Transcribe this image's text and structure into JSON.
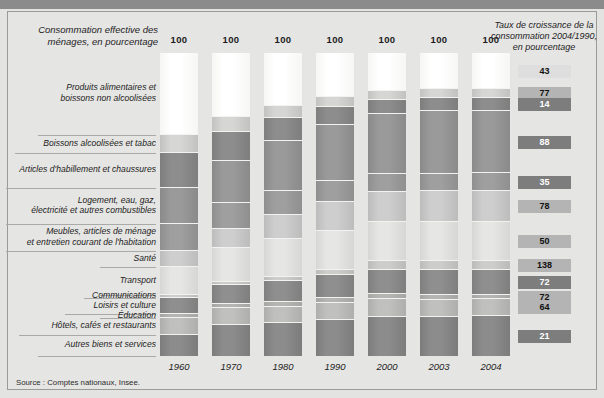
{
  "chart_data": {
    "type": "bar",
    "title": "Consommation effective des ménages, en pourcentage",
    "subtitle_right": "Taux de croissance de la consommation 2004/1990, en pourcentage",
    "xlabel": "",
    "ylabel": "",
    "ylim": [
      0,
      100
    ],
    "stacked": true,
    "normalized_total": 100,
    "grid": false,
    "legend": "left-labels",
    "categories": [
      "1960",
      "1970",
      "1980",
      "1990",
      "2000",
      "2003",
      "2004"
    ],
    "series": [
      {
        "name": "Produits alimentaires et boissons non alcoolisées",
        "values": [
          27.0,
          21.0,
          17.5,
          14.5,
          12.5,
          12.0,
          12.0
        ],
        "growth": 43
      },
      {
        "name": "Boissons alcoolisées et tabac",
        "values": [
          6.0,
          5.0,
          4.0,
          3.3,
          3.0,
          3.0,
          3.0
        ],
        "growth": 77
      },
      {
        "name": "Articles d'habillement et chaussures",
        "values": [
          11.5,
          9.5,
          7.5,
          6.0,
          4.8,
          4.3,
          4.2
        ],
        "growth": 14
      },
      {
        "name": "Logement, eau, gaz, électricité et autres combustibles",
        "values": [
          12.0,
          14.0,
          16.5,
          18.5,
          19.5,
          20.5,
          20.5
        ],
        "growth": 88
      },
      {
        "name": "Meubles, articles de ménage et entretien courant de l'habitation",
        "values": [
          9.0,
          8.5,
          8.0,
          6.8,
          6.0,
          5.8,
          5.8
        ],
        "growth": 35
      },
      {
        "name": "Santé",
        "values": [
          5.0,
          6.5,
          8.0,
          9.5,
          10.0,
          10.2,
          10.2
        ],
        "growth": 78
      },
      {
        "name": "Transport",
        "values": [
          9.5,
          11.0,
          12.5,
          13.0,
          13.0,
          12.8,
          12.8
        ],
        "growth": 50
      },
      {
        "name": "Communications",
        "values": [
          0.8,
          1.0,
          1.3,
          1.8,
          2.7,
          3.0,
          3.0
        ],
        "growth": 138
      },
      {
        "name": "Loisirs et culture",
        "values": [
          5.5,
          6.5,
          7.0,
          7.5,
          8.2,
          8.3,
          8.3
        ],
        "growth": 72
      },
      {
        "name": "Éducation",
        "values": [
          1.2,
          1.3,
          1.4,
          1.5,
          1.5,
          1.5,
          1.5
        ],
        "growth": 72
      },
      {
        "name": "Hôtels, cafés et restaurants",
        "values": [
          5.5,
          5.5,
          5.5,
          5.6,
          5.8,
          5.6,
          5.6
        ],
        "growth": 64
      },
      {
        "name": "Autres biens et services",
        "values": [
          7.0,
          10.2,
          10.8,
          12.0,
          13.0,
          13.0,
          13.1
        ],
        "growth": 21
      }
    ],
    "bar_top_labels": [
      "100",
      "100",
      "100",
      "100",
      "100",
      "100",
      "100"
    ],
    "growth_values": [
      43,
      77,
      14,
      88,
      35,
      78,
      50,
      138,
      72,
      72,
      64,
      21
    ],
    "source": "Source : Comptes nationaux, Insee."
  },
  "header": {
    "left_title": "Consommation effective\ndes ménages, en pourcentage",
    "right_title": "Taux de croissance\nde la consommation\n2004/1990,\nen pourcentage"
  },
  "labels": [
    {
      "text": "Produits alimentaires et\nboissons non alcoolisées"
    },
    {
      "text": "Boissons alcoolisées et tabac"
    },
    {
      "text": "Articles d'habillement et chaussures"
    },
    {
      "text": "Logement, eau, gaz,\nélectricité et autres combustibles"
    },
    {
      "text": "Meubles, articles de ménage\net entretien courant de l'habitation"
    },
    {
      "text": "Santé"
    },
    {
      "text": "Transport"
    },
    {
      "text": "Communications"
    },
    {
      "text": "Loisirs et culture"
    },
    {
      "text": "Éducation"
    },
    {
      "text": "Hôtels, cafés et restaurants"
    },
    {
      "text": "Autres biens et services"
    }
  ],
  "years": [
    "1960",
    "1970",
    "1980",
    "1990",
    "2000",
    "2003",
    "2004"
  ],
  "top_labels": [
    "100",
    "100",
    "100",
    "100",
    "100",
    "100",
    "100"
  ],
  "growth_boxes": [
    {
      "value": "43",
      "tone": "light"
    },
    {
      "value": "77",
      "tone": "mid"
    },
    {
      "value": "14",
      "tone": "dark"
    },
    {
      "value": "88",
      "tone": "dark"
    },
    {
      "value": "35",
      "tone": "dark"
    },
    {
      "value": "78",
      "tone": "mid"
    },
    {
      "value": "50",
      "tone": "mid"
    },
    {
      "value": "138",
      "tone": "mid"
    },
    {
      "value": "72",
      "tone": "dark"
    },
    {
      "value": "72",
      "tone": "mid"
    },
    {
      "value": "64",
      "tone": "mid"
    },
    {
      "value": "21",
      "tone": "dark"
    }
  ],
  "footer": {
    "source": "Source : Comptes nationaux, Insee."
  },
  "colors": {
    "background": "#e3e3e1",
    "frame": "#9a9a98",
    "topbar": "#8b8b8b",
    "segment_light": "#f4f4f2",
    "segment_mid": "#c8c8c6",
    "segment_dark": "#909090",
    "text": "#1d1d1d"
  }
}
